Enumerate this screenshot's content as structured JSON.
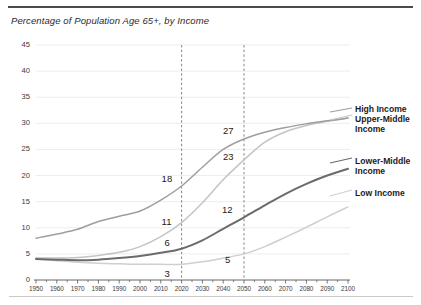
{
  "page": {
    "top_cropped_text": "",
    "subtitle": "Percentage of Population Age 65+, by Income"
  },
  "legend": {
    "high_income": "High Income",
    "upper_middle_income": "Upper-Middle Income",
    "lower_middle_income": "Lower-Middle Income",
    "low_income": "Low Income"
  },
  "colors": {
    "high_income": "#9e9e9e",
    "upper_middle_income": "#c4c4c4",
    "lower_middle_income": "#6b6b6b",
    "low_income": "#cfcfcf",
    "gridline": "#ededed",
    "marker_line": "#7a7a7a",
    "axis": "#555555",
    "text": "#231f20"
  },
  "chart_data": {
    "type": "line",
    "title": "Percentage of Population Age 65+, by Income",
    "subtitle": "Percentage of Population Age 65+, by Income",
    "xlabel": "",
    "ylabel": "",
    "xlim": [
      1950,
      2100
    ],
    "ylim": [
      0,
      45
    ],
    "grid": true,
    "legend_position": "right",
    "x": [
      1950,
      1960,
      1970,
      1980,
      1990,
      2000,
      2010,
      2020,
      2030,
      2040,
      2050,
      2060,
      2070,
      2080,
      2090,
      2100
    ],
    "xticks": [
      "1950",
      "1960",
      "1970",
      "1980",
      "1990",
      "2000",
      "2010",
      "2020",
      "2030",
      "2040",
      "2050",
      "2060",
      "2070",
      "2080",
      "2090",
      "2100"
    ],
    "yticks": [
      0,
      5,
      10,
      15,
      20,
      25,
      30,
      35,
      40,
      45
    ],
    "reference_lines": [
      2020,
      2050
    ],
    "series": [
      {
        "name": "High Income",
        "color": "#9e9e9e",
        "values": [
          8.0,
          8.8,
          9.7,
          11.2,
          12.2,
          13.2,
          15.3,
          18.0,
          21.6,
          25.0,
          27.0,
          28.3,
          29.2,
          29.9,
          30.5,
          31.0
        ],
        "labels": [
          {
            "x": 2020,
            "value": 18
          },
          {
            "x": 2050,
            "value": 27
          }
        ]
      },
      {
        "name": "Upper-Middle Income",
        "color": "#c4c4c4",
        "values": [
          4.2,
          4.2,
          4.3,
          4.7,
          5.3,
          6.4,
          8.3,
          11.0,
          14.8,
          19.2,
          23.0,
          26.4,
          28.4,
          29.6,
          30.4,
          31.0
        ],
        "labels": [
          {
            "x": 2020,
            "value": 11
          },
          {
            "x": 2050,
            "value": 23
          }
        ]
      },
      {
        "name": "Lower-Middle Income",
        "color": "#6b6b6b",
        "values": [
          4.0,
          3.9,
          3.8,
          3.9,
          4.2,
          4.6,
          5.2,
          6.0,
          7.6,
          9.8,
          12.0,
          14.3,
          16.5,
          18.4,
          20.0,
          21.3
        ],
        "labels": [
          {
            "x": 2020,
            "value": 6
          },
          {
            "x": 2050,
            "value": 12
          }
        ]
      },
      {
        "name": "Low Income",
        "color": "#cfcfcf",
        "values": [
          4.0,
          3.7,
          3.4,
          3.2,
          3.1,
          3.0,
          3.0,
          3.0,
          3.5,
          4.2,
          5.0,
          6.4,
          8.2,
          10.1,
          12.1,
          14.0
        ],
        "labels": [
          {
            "x": 2020,
            "value": 3
          },
          {
            "x": 2050,
            "value": 5
          }
        ]
      }
    ],
    "point_labels": [
      {
        "series": "High Income",
        "x": 2020,
        "value": 18
      },
      {
        "series": "Upper-Middle Income",
        "x": 2020,
        "value": 11
      },
      {
        "series": "Lower-Middle Income",
        "x": 2020,
        "value": 6
      },
      {
        "series": "Low Income",
        "x": 2020,
        "value": 3
      },
      {
        "series": "High Income",
        "x": 2050,
        "value": 27
      },
      {
        "series": "Upper-Middle Income",
        "x": 2050,
        "value": 23
      },
      {
        "series": "Lower-Middle Income",
        "x": 2050,
        "value": 12
      },
      {
        "series": "Low Income",
        "x": 2050,
        "value": 5
      }
    ]
  }
}
